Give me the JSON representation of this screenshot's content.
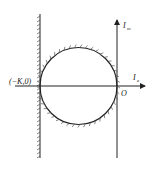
{
  "diagram": {
    "labels": {
      "point": "(−K,0)",
      "origin": "O",
      "im_axis_main": "I",
      "im_axis_sub": "m",
      "re_axis_main": "I",
      "re_axis_sub": "e"
    },
    "colors": {
      "stroke": "#222222",
      "background": "#ffffff"
    }
  }
}
